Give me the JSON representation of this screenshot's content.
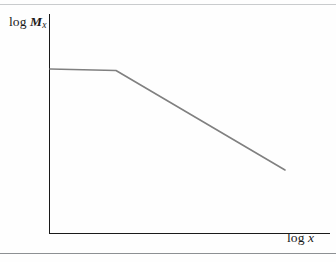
{
  "figure": {
    "background_color": "#fefefe",
    "width": 336,
    "height": 262,
    "top_rule_color": "#c9cbcd",
    "bottom_rule_color": "#8d9093",
    "axis_color": "#1a1a1a",
    "curve_color": "#808080"
  },
  "labels": {
    "y_axis_op": "log",
    "y_axis_var": "M",
    "y_axis_sub": "x",
    "x_axis_op": "log",
    "x_axis_var": "x"
  },
  "chart_data": {
    "type": "line",
    "title": "",
    "subtitle": "",
    "xlabel": "log x",
    "ylabel": "log M_x",
    "xlim": [
      0,
      10
    ],
    "ylim": [
      0,
      10
    ],
    "grid": false,
    "legend": "none",
    "xticks": [],
    "yticks": [],
    "axis_style": "open-left-bottom-spines",
    "annotations": [
      "Schematic log-log plot: a flat plateau at low log x followed by a steeper linear decline (power-law roll-off) at higher log x.",
      "Axes are unlabeled/schematic — no numeric tick marks are drawn."
    ],
    "series": [
      {
        "name": "log M_x",
        "color": "#808080",
        "line_width_px": 1.6,
        "marker": "none",
        "points_px": [
          {
            "x": 50,
            "y": 69
          },
          {
            "x": 116,
            "y": 70.5
          },
          {
            "x": 285,
            "y": 170
          }
        ],
        "x": [
          0.0,
          2.36,
          8.39
        ],
        "values": [
          7.5,
          7.43,
          2.88
        ],
        "segments": [
          {
            "name": "plateau",
            "from_index": 0,
            "to_index": 1,
            "slope": "≈0 (flat)"
          },
          {
            "name": "power-law decline",
            "from_index": 1,
            "to_index": 2,
            "slope": "negative (steep)"
          }
        ]
      }
    ]
  },
  "geometry": {
    "y_axis": {
      "x": 49.5,
      "y_top": 14,
      "y_bottom": 233.5
    },
    "x_axis": {
      "y": 233.5,
      "x_left": 49.5,
      "x_right": 330
    }
  }
}
